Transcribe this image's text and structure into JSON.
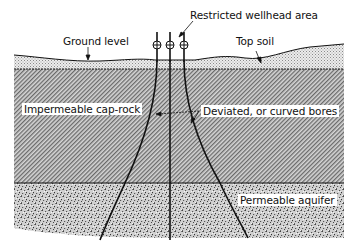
{
  "figure": {
    "type": "geological cross-section"
  },
  "labels": {
    "restricted_wellhead": "Restricted wellhead area",
    "ground_level": "Ground level",
    "top_soil": "Top soil",
    "cap_rock": "Impermeable cap-rock",
    "deviated_bores": "Deviated, or curved bores",
    "aquifer": "Permeable aquifer"
  },
  "layers": [
    {
      "name": "Top soil",
      "pattern": "fine-dots"
    },
    {
      "name": "Impermeable cap-rock",
      "pattern": "diagonal-hatch"
    },
    {
      "name": "Permeable aquifer",
      "pattern": "coarse-stipple"
    }
  ],
  "wells": {
    "count": 3,
    "wellhead_symbol": "circle-cross"
  },
  "colors": {
    "ink": "#111111",
    "topsoil_fill": "#e6e6e6",
    "caprock_fill": "#b4b4b4",
    "aquifer_fill": "#c8c8c8",
    "background": "#ffffff"
  }
}
